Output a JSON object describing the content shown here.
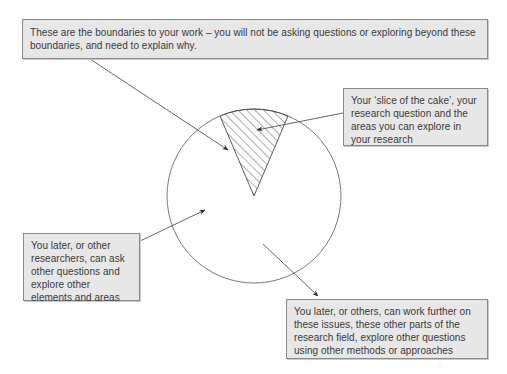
{
  "diagram": {
    "type": "annotated-pie",
    "pie": {
      "center": [
        254,
        196
      ],
      "radius": 87,
      "slice": {
        "label": "research slice",
        "start_angle_deg_from_top": -23,
        "end_angle_deg_from_top": 23,
        "fill": "hatched"
      }
    },
    "colors": {
      "box_fill": "#e7e7e7",
      "box_border": "#8a8a8a",
      "text": "#3a3a3a",
      "line": "#555555",
      "circle": "#6a6a6a"
    },
    "callouts": {
      "boundaries": {
        "text": "These are the boundaries to your work – you will not be asking questions or exploring beyond these boundaries, and need to explain why."
      },
      "slice": {
        "text": "Your ‘slice of the cake’, your research question and the areas you can explore in your research"
      },
      "others_left": {
        "text": "You later, or other researchers, can ask other questions and explore other elements and areas"
      },
      "others_right": {
        "text": "You later, or others, can work further on these issues, these other parts of the research field, explore other questions using other methods or approaches"
      }
    }
  }
}
